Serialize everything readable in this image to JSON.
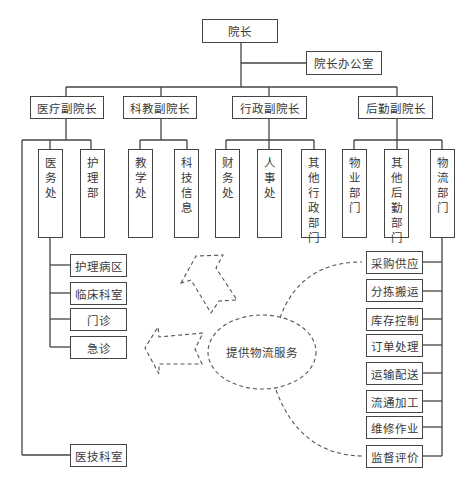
{
  "diagram": {
    "top": {
      "label": "院长"
    },
    "office": {
      "label": "院长办公室"
    },
    "vice_presidents": [
      {
        "label": "医疗副院长"
      },
      {
        "label": "科教副院长"
      },
      {
        "label": "行政副院长"
      },
      {
        "label": "后勤副院长"
      }
    ],
    "departments": [
      {
        "label": "医务处",
        "parent": "医疗副院长"
      },
      {
        "label": "护理部",
        "parent": "医疗副院长"
      },
      {
        "label": "教学处",
        "parent": "科教副院长"
      },
      {
        "label": "科技信息",
        "parent": "科教副院长"
      },
      {
        "label": "财务处",
        "parent": "行政副院长"
      },
      {
        "label": "人事处",
        "parent": "行政副院长"
      },
      {
        "label": "其他行政部门",
        "parent": "行政副院长"
      },
      {
        "label": "物业部门",
        "parent": "后勤副院长"
      },
      {
        "label": "其他后勤部门",
        "parent": "后勤副院长"
      },
      {
        "label": "物流部门",
        "parent": "后勤副院长"
      }
    ],
    "clinical_units": [
      {
        "label": "护理病区"
      },
      {
        "label": "临床科室"
      },
      {
        "label": "门诊"
      },
      {
        "label": "急诊"
      }
    ],
    "medtech": {
      "label": "医技科室"
    },
    "logistics_functions": [
      {
        "label": "采购供应"
      },
      {
        "label": "分拣搬运"
      },
      {
        "label": "库存控制"
      },
      {
        "label": "订单处理"
      },
      {
        "label": "运输配送"
      },
      {
        "label": "流通加工"
      },
      {
        "label": "维修作业"
      },
      {
        "label": "监督评价"
      }
    ],
    "service_ellipse": {
      "label": "提供物流服务"
    },
    "colors": {
      "line": "#444444",
      "dashed": "#555555",
      "text": "#3a3a3a",
      "background": "#ffffff"
    }
  }
}
